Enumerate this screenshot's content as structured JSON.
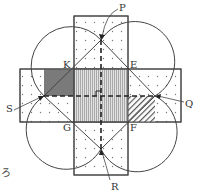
{
  "diagram": {
    "points": {
      "P": "P",
      "Q": "Q",
      "R": "R",
      "S": "S",
      "K": "K",
      "E": "E",
      "F": "F",
      "G": "G"
    },
    "caption_fragment": "ろ",
    "colors": {
      "line": "#444444",
      "dark_fill": "#7a7a7a",
      "pattern_fill": "#bdbdbd",
      "dot": "#777777",
      "background": "#ffffff"
    }
  }
}
